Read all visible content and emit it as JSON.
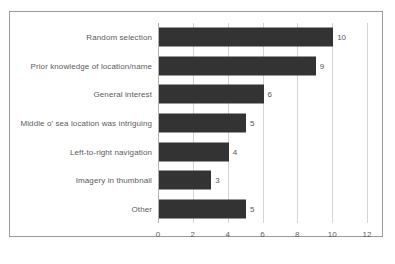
{
  "chart_data": {
    "type": "bar",
    "orientation": "horizontal",
    "title": "",
    "xlabel": "",
    "ylabel": "",
    "categories": [
      "Random selection",
      "Prior knowledge of location/name",
      "General interest",
      "Middle o' sea location was intriguing",
      "Left-to-right navigation",
      "Imagery in thumbnail",
      "Other"
    ],
    "values": [
      10,
      9,
      6,
      5,
      4,
      3,
      5
    ],
    "value_labels": [
      "10",
      "9",
      "6",
      "5",
      "4",
      "3",
      "5"
    ],
    "xlim": [
      0,
      12
    ],
    "xticks": [
      0,
      2,
      4,
      6,
      8,
      10,
      12
    ],
    "xtick_labels": [
      "0",
      "2",
      "4",
      "6",
      "8",
      "10",
      "12"
    ],
    "grid": "vertical",
    "legend": "none",
    "bar_color": "#333333",
    "gridline_color": "#d4d4d4",
    "frame_color": "#9a9a9a",
    "label_color": "#5b5b5b"
  },
  "caption": {
    "text": ""
  }
}
